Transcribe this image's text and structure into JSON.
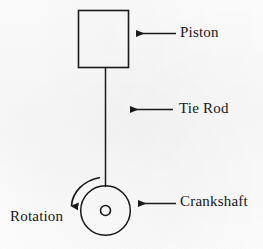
{
  "diagram": {
    "background_color": "#fcfcfc",
    "stroke_color": "#1a1a1a",
    "text_color": "#161616",
    "labels": {
      "piston": "Piston",
      "tie_rod": "Tie Rod",
      "crankshaft": "Crankshaft",
      "rotation": "Rotation"
    },
    "parts": [
      {
        "name": "piston",
        "shape": "rectangle",
        "label": "Piston",
        "x": 78,
        "y": 10,
        "width": 50,
        "height": 58
      },
      {
        "name": "tie-rod",
        "shape": "line",
        "label": "Tie Rod",
        "x1": 105,
        "y1": 68,
        "x2": 105,
        "y2": 187
      },
      {
        "name": "crankshaft",
        "shape": "circle",
        "label": "Crankshaft",
        "cx": 105,
        "cy": 210,
        "r": 25
      },
      {
        "name": "crankshaft-hub",
        "shape": "circle",
        "label": "",
        "cx": 105,
        "cy": 210,
        "r": 5
      },
      {
        "name": "rotation-arc",
        "shape": "arc-arrow",
        "label": "Rotation",
        "direction": "counterclockwise"
      }
    ],
    "callout_arrows": [
      {
        "name": "piston-arrow",
        "points_to": "piston",
        "x1": 175,
        "y1": 33,
        "x2": 136,
        "y2": 33
      },
      {
        "name": "tie-rod-arrow",
        "points_to": "tie-rod",
        "x1": 172,
        "y1": 109,
        "x2": 130,
        "y2": 109
      },
      {
        "name": "crankshaft-arrow",
        "points_to": "crankshaft",
        "x1": 175,
        "y1": 203,
        "x2": 138,
        "y2": 203
      }
    ]
  }
}
